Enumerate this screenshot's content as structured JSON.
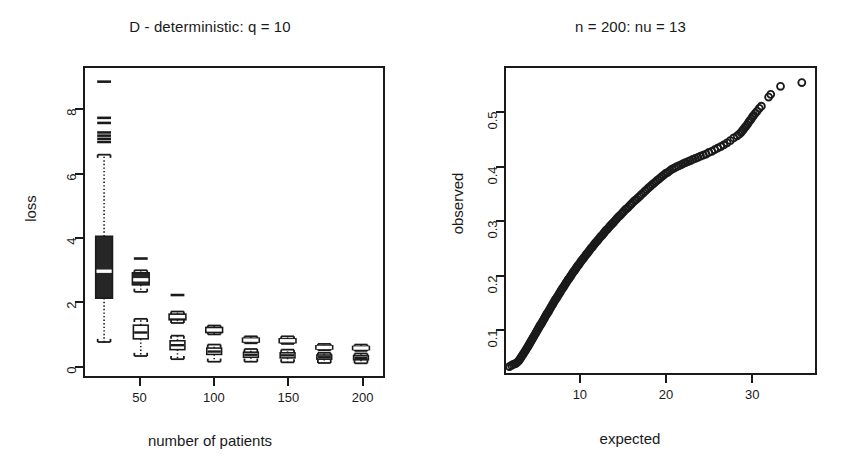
{
  "figure": {
    "background": "#ffffff",
    "ink_color": "#1a1a1a",
    "panels": 2
  },
  "left_panel": {
    "title": "D - deterministic: q = 10",
    "xlabel": "number of patients",
    "ylabel": "loss"
  },
  "right_panel": {
    "title": "n = 200: nu = 13",
    "xlabel": "expected",
    "ylabel": "observed"
  },
  "chart_data": [
    {
      "type": "boxplot",
      "panel": "left",
      "title": "D - deterministic: q = 10",
      "xlabel": "number of patients",
      "ylabel": "loss",
      "xlim": [
        12,
        215
      ],
      "ylim": [
        -0.35,
        9.35
      ],
      "xticks": [
        50,
        100,
        150,
        200
      ],
      "xticklabels": [
        "50",
        "100",
        "150",
        "200"
      ],
      "yticks": [
        0,
        2,
        4,
        6,
        8
      ],
      "yticklabels": [
        "0",
        "2",
        "4",
        "6",
        "8"
      ],
      "grid": false,
      "legend": "none",
      "box_fill_dark": "#262626",
      "box_fill_light": "#ffffff",
      "median_color_on_dark": "#ffffff",
      "median_color_on_light": "#1a1a1a",
      "whisker_style": "dotted",
      "notes": "Two boxplots per x position: an upper dark/filled box and a lower open/white box.",
      "groups": [
        {
          "x": 25,
          "boxes": [
            {
              "style": "dark",
              "lower_whisker": 0.72,
              "q1": 2.1,
              "median": 2.95,
              "q3": 4.05,
              "upper_whisker": 6.62,
              "outliers": [
                7.02,
                7.12,
                7.22,
                7.32,
                7.62,
                7.78,
                8.92
              ]
            }
          ]
        },
        {
          "x": 50,
          "boxes": [
            {
              "style": "dark",
              "lower_whisker": 2.3,
              "q1": 2.52,
              "median": 2.68,
              "q3": 2.9,
              "upper_whisker": 2.98,
              "outliers": [
                3.35
              ]
            },
            {
              "style": "light",
              "lower_whisker": 0.28,
              "q1": 0.82,
              "median": 1.02,
              "q3": 1.25,
              "upper_whisker": 1.45,
              "outliers": []
            }
          ]
        },
        {
          "x": 75,
          "boxes": [
            {
              "style": "dark",
              "lower_whisker": 1.32,
              "q1": 1.42,
              "median": 1.52,
              "q3": 1.6,
              "upper_whisker": 1.68,
              "outliers": [
                2.2
              ]
            },
            {
              "style": "light",
              "lower_whisker": 0.18,
              "q1": 0.48,
              "median": 0.62,
              "q3": 0.76,
              "upper_whisker": 0.92,
              "outliers": []
            }
          ]
        },
        {
          "x": 100,
          "boxes": [
            {
              "style": "dark",
              "lower_whisker": 0.96,
              "q1": 1.02,
              "median": 1.1,
              "q3": 1.18,
              "upper_whisker": 1.24,
              "outliers": []
            },
            {
              "style": "light",
              "lower_whisker": 0.1,
              "q1": 0.33,
              "median": 0.42,
              "q3": 0.53,
              "upper_whisker": 0.64,
              "outliers": []
            }
          ]
        },
        {
          "x": 125,
          "boxes": [
            {
              "style": "dark",
              "lower_whisker": 0.68,
              "q1": 0.72,
              "median": 0.78,
              "q3": 0.84,
              "upper_whisker": 0.9,
              "outliers": []
            },
            {
              "style": "light",
              "lower_whisker": 0.1,
              "q1": 0.24,
              "median": 0.32,
              "q3": 0.4,
              "upper_whisker": 0.5,
              "outliers": []
            }
          ]
        },
        {
          "x": 150,
          "boxes": [
            {
              "style": "dark",
              "lower_whisker": 0.66,
              "q1": 0.7,
              "median": 0.76,
              "q3": 0.82,
              "upper_whisker": 0.9,
              "outliers": []
            },
            {
              "style": "light",
              "lower_whisker": 0.08,
              "q1": 0.22,
              "median": 0.3,
              "q3": 0.38,
              "upper_whisker": 0.48,
              "outliers": []
            }
          ]
        },
        {
          "x": 175,
          "boxes": [
            {
              "style": "dark",
              "lower_whisker": 0.46,
              "q1": 0.5,
              "median": 0.55,
              "q3": 0.6,
              "upper_whisker": 0.66,
              "outliers": []
            },
            {
              "style": "light",
              "lower_whisker": 0.06,
              "q1": 0.18,
              "median": 0.24,
              "q3": 0.31,
              "upper_whisker": 0.38,
              "outliers": []
            }
          ]
        },
        {
          "x": 200,
          "boxes": [
            {
              "style": "dark",
              "lower_whisker": 0.44,
              "q1": 0.48,
              "median": 0.53,
              "q3": 0.58,
              "upper_whisker": 0.64,
              "outliers": []
            },
            {
              "style": "light",
              "lower_whisker": 0.05,
              "q1": 0.16,
              "median": 0.22,
              "q3": 0.29,
              "upper_whisker": 0.36,
              "outliers": []
            }
          ]
        }
      ]
    },
    {
      "type": "scatter",
      "panel": "right",
      "subtype": "qq-plot",
      "title": "n = 200: nu = 13",
      "xlabel": "expected",
      "ylabel": "observed",
      "xlim": [
        1.2,
        37.5
      ],
      "ylim": [
        0.018,
        0.585
      ],
      "xticks": [
        10,
        20,
        30
      ],
      "xticklabels": [
        "10",
        "20",
        "30"
      ],
      "yticks": [
        0.1,
        0.2,
        0.3,
        0.4,
        0.5
      ],
      "yticklabels": [
        "0.1",
        "0.2",
        "0.3",
        "0.4",
        "0.5"
      ],
      "grid": false,
      "legend": "none",
      "marker": "open-circle",
      "marker_size_px": 7,
      "marker_color": "#1a1a1a",
      "n_points": 200,
      "points": [
        [
          1.6,
          0.03
        ],
        [
          1.85,
          0.032
        ],
        [
          2.05,
          0.034
        ],
        [
          2.22,
          0.035
        ],
        [
          2.38,
          0.036
        ],
        [
          2.52,
          0.038
        ],
        [
          2.66,
          0.04
        ],
        [
          2.8,
          0.043
        ],
        [
          2.93,
          0.046
        ],
        [
          3.05,
          0.049
        ],
        [
          3.18,
          0.052
        ],
        [
          3.3,
          0.055
        ],
        [
          3.42,
          0.058
        ],
        [
          3.54,
          0.061
        ],
        [
          3.65,
          0.064
        ],
        [
          3.77,
          0.067
        ],
        [
          3.88,
          0.07
        ],
        [
          3.99,
          0.073
        ],
        [
          4.1,
          0.076
        ],
        [
          4.21,
          0.079
        ],
        [
          4.32,
          0.082
        ],
        [
          4.43,
          0.085
        ],
        [
          4.54,
          0.088
        ],
        [
          4.65,
          0.091
        ],
        [
          4.76,
          0.094
        ],
        [
          4.86,
          0.097
        ],
        [
          4.97,
          0.1
        ],
        [
          5.08,
          0.103
        ],
        [
          5.18,
          0.106
        ],
        [
          5.29,
          0.108
        ],
        [
          5.4,
          0.111
        ],
        [
          5.5,
          0.114
        ],
        [
          5.61,
          0.117
        ],
        [
          5.72,
          0.12
        ],
        [
          5.82,
          0.123
        ],
        [
          5.93,
          0.126
        ],
        [
          6.04,
          0.129
        ],
        [
          6.15,
          0.131
        ],
        [
          6.25,
          0.134
        ],
        [
          6.36,
          0.137
        ],
        [
          6.47,
          0.14
        ],
        [
          6.58,
          0.143
        ],
        [
          6.69,
          0.146
        ],
        [
          6.8,
          0.149
        ],
        [
          6.91,
          0.152
        ],
        [
          7.02,
          0.155
        ],
        [
          7.13,
          0.157
        ],
        [
          7.24,
          0.16
        ],
        [
          7.35,
          0.163
        ],
        [
          7.47,
          0.166
        ],
        [
          7.58,
          0.169
        ],
        [
          7.69,
          0.172
        ],
        [
          7.81,
          0.175
        ],
        [
          7.92,
          0.177
        ],
        [
          8.04,
          0.18
        ],
        [
          8.15,
          0.183
        ],
        [
          8.27,
          0.186
        ],
        [
          8.39,
          0.189
        ],
        [
          8.51,
          0.192
        ],
        [
          8.63,
          0.194
        ],
        [
          8.75,
          0.197
        ],
        [
          8.87,
          0.2
        ],
        [
          8.99,
          0.203
        ],
        [
          9.11,
          0.206
        ],
        [
          9.23,
          0.208
        ],
        [
          9.36,
          0.211
        ],
        [
          9.48,
          0.214
        ],
        [
          9.61,
          0.217
        ],
        [
          9.74,
          0.219
        ],
        [
          9.86,
          0.222
        ],
        [
          9.99,
          0.225
        ],
        [
          10.12,
          0.228
        ],
        [
          10.25,
          0.23
        ],
        [
          10.38,
          0.233
        ],
        [
          10.52,
          0.236
        ],
        [
          10.65,
          0.239
        ],
        [
          10.78,
          0.241
        ],
        [
          10.92,
          0.244
        ],
        [
          11.06,
          0.247
        ],
        [
          11.19,
          0.25
        ],
        [
          11.33,
          0.252
        ],
        [
          11.47,
          0.255
        ],
        [
          11.61,
          0.258
        ],
        [
          11.76,
          0.261
        ],
        [
          11.9,
          0.263
        ],
        [
          12.04,
          0.266
        ],
        [
          12.19,
          0.269
        ],
        [
          12.34,
          0.272
        ],
        [
          12.49,
          0.274
        ],
        [
          12.64,
          0.277
        ],
        [
          12.79,
          0.28
        ],
        [
          12.94,
          0.283
        ],
        [
          13.09,
          0.285
        ],
        [
          13.25,
          0.288
        ],
        [
          13.41,
          0.291
        ],
        [
          13.57,
          0.294
        ],
        [
          13.73,
          0.296
        ],
        [
          13.89,
          0.299
        ],
        [
          14.05,
          0.302
        ],
        [
          14.22,
          0.305
        ],
        [
          14.38,
          0.308
        ],
        [
          14.55,
          0.31
        ],
        [
          14.72,
          0.313
        ],
        [
          14.9,
          0.316
        ],
        [
          15.07,
          0.319
        ],
        [
          15.25,
          0.322
        ],
        [
          15.42,
          0.324
        ],
        [
          15.6,
          0.327
        ],
        [
          15.79,
          0.33
        ],
        [
          15.97,
          0.333
        ],
        [
          16.16,
          0.336
        ],
        [
          16.35,
          0.339
        ],
        [
          16.54,
          0.341
        ],
        [
          16.73,
          0.344
        ],
        [
          16.93,
          0.347
        ],
        [
          17.12,
          0.35
        ],
        [
          17.33,
          0.353
        ],
        [
          17.53,
          0.356
        ],
        [
          17.73,
          0.359
        ],
        [
          17.94,
          0.362
        ],
        [
          18.15,
          0.365
        ],
        [
          18.37,
          0.368
        ],
        [
          18.59,
          0.371
        ],
        [
          18.81,
          0.374
        ],
        [
          19.03,
          0.377
        ],
        [
          19.26,
          0.38
        ],
        [
          19.49,
          0.383
        ],
        [
          19.72,
          0.386
        ],
        [
          19.96,
          0.389
        ],
        [
          20.2,
          0.391
        ],
        [
          20.45,
          0.394
        ],
        [
          20.7,
          0.397
        ],
        [
          20.95,
          0.399
        ],
        [
          21.21,
          0.401
        ],
        [
          21.47,
          0.403
        ],
        [
          21.74,
          0.405
        ],
        [
          22.01,
          0.407
        ],
        [
          22.29,
          0.409
        ],
        [
          22.57,
          0.411
        ],
        [
          22.86,
          0.413
        ],
        [
          23.15,
          0.415
        ],
        [
          23.45,
          0.417
        ],
        [
          23.75,
          0.419
        ],
        [
          24.06,
          0.421
        ],
        [
          24.38,
          0.423
        ],
        [
          24.7,
          0.425
        ],
        [
          25.03,
          0.428
        ],
        [
          25.37,
          0.43
        ],
        [
          25.71,
          0.433
        ],
        [
          26.06,
          0.436
        ],
        [
          26.42,
          0.439
        ],
        [
          26.79,
          0.442
        ],
        [
          27.17,
          0.446
        ],
        [
          27.55,
          0.45
        ],
        [
          27.95,
          0.455
        ],
        [
          28.35,
          0.459
        ],
        [
          28.6,
          0.462
        ],
        [
          28.8,
          0.465
        ],
        [
          28.95,
          0.468
        ],
        [
          29.1,
          0.471
        ],
        [
          29.25,
          0.474
        ],
        [
          29.4,
          0.477
        ],
        [
          29.55,
          0.48
        ],
        [
          29.7,
          0.484
        ],
        [
          29.85,
          0.487
        ],
        [
          30.0,
          0.49
        ],
        [
          30.15,
          0.494
        ],
        [
          30.3,
          0.497
        ],
        [
          30.5,
          0.501
        ],
        [
          30.7,
          0.505
        ],
        [
          30.95,
          0.51
        ],
        [
          31.2,
          0.514
        ],
        [
          32.05,
          0.531
        ],
        [
          32.3,
          0.536
        ],
        [
          33.45,
          0.551
        ],
        [
          35.95,
          0.558
        ]
      ],
      "annotations": [
        "Points lie close to a straight line indicating good distributional fit",
        "Upper tail shows a few separated outlying points"
      ]
    }
  ]
}
